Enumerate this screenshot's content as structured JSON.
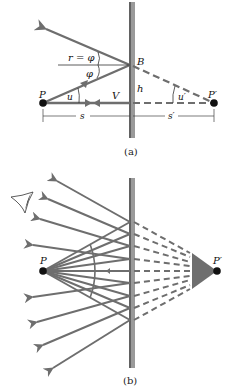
{
  "colors": {
    "ray": "#6e6e6e",
    "mirror_fill": "#9a9a9a",
    "mirror_edge": "#2a2a2a",
    "point": "#111111",
    "text": "#111111"
  },
  "diagram_a": {
    "caption": "(a)",
    "labels": {
      "object_point": "P",
      "image_point": "P′",
      "reflection_point": "B",
      "vertex": "V",
      "height": "h",
      "incidence_eq": "r = φ",
      "phi": "φ",
      "angle_u": "u",
      "angle_u_prime": "u′",
      "object_distance": "s",
      "image_distance": "s′"
    }
  },
  "diagram_b": {
    "caption": "(b)",
    "labels": {
      "object_point": "P",
      "image_point": "P′"
    },
    "eye_icon": "eye-icon",
    "ray_count": 9
  }
}
